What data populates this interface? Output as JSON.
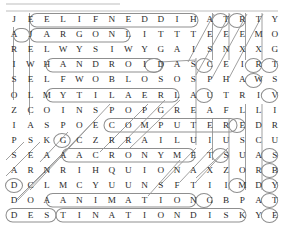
{
  "puzzle": {
    "title": "Word Search Grid",
    "rows": 14,
    "cols": 17,
    "grid": [
      [
        "J",
        "E",
        "E",
        "L",
        "I",
        "F",
        "N",
        "E",
        "D",
        "D",
        "I",
        "H",
        "A",
        "T",
        "R",
        "T",
        "Y"
      ],
      [
        "A",
        "J",
        "A",
        "R",
        "G",
        "O",
        "N",
        "L",
        "I",
        "T",
        "T",
        "T",
        "E",
        "E",
        "E",
        "M",
        "O"
      ],
      [
        "R",
        "E",
        "L",
        "W",
        "Y",
        "S",
        "I",
        "W",
        "Y",
        "G",
        "A",
        "I",
        "S",
        "N",
        "X",
        "X",
        "G"
      ],
      [
        "I",
        "W",
        "H",
        "A",
        "N",
        "D",
        "R",
        "O",
        "I",
        "D",
        "A",
        "S",
        "C",
        "E",
        "I",
        "R",
        "T"
      ],
      [
        "S",
        "E",
        "L",
        "F",
        "W",
        "O",
        "B",
        "L",
        "O",
        "S",
        "O",
        "S",
        "P",
        "H",
        "A",
        "W",
        "S"
      ],
      [
        "O",
        "L",
        "M",
        "Y",
        "T",
        "I",
        "L",
        "A",
        "E",
        "R",
        "L",
        "A",
        "U",
        "T",
        "R",
        "I",
        "V"
      ],
      [
        "Z",
        "C",
        "O",
        "I",
        "N",
        "S",
        "P",
        "O",
        "P",
        "G",
        "R",
        "E",
        "A",
        "F",
        "L",
        "L",
        "I"
      ],
      [
        "I",
        "A",
        "S",
        "P",
        "O",
        "E",
        "C",
        "O",
        "M",
        "P",
        "U",
        "T",
        "E",
        "R",
        "E",
        "D",
        "R"
      ],
      [
        "P",
        "S",
        "K",
        "G",
        "C",
        "Z",
        "R",
        "R",
        "A",
        "I",
        "L",
        "U",
        "I",
        "U",
        "S",
        "C",
        "U"
      ],
      [
        "S",
        "E",
        "A",
        "A",
        "A",
        "C",
        "R",
        "O",
        "N",
        "Y",
        "M",
        "E",
        "T",
        "S",
        "U",
        "A",
        "S"
      ],
      [
        "A",
        "R",
        "N",
        "R",
        "I",
        "H",
        "Q",
        "U",
        "I",
        "O",
        "N",
        "A",
        "X",
        "Z",
        "O",
        "R",
        "B"
      ],
      [
        "D",
        "C",
        "L",
        "M",
        "C",
        "Y",
        "U",
        "U",
        "N",
        "S",
        "F",
        "T",
        "I",
        "I",
        "M",
        "D",
        "Y"
      ],
      [
        "D",
        "O",
        "A",
        "A",
        "N",
        "I",
        "M",
        "A",
        "T",
        "I",
        "O",
        "N",
        "G",
        "B",
        "P",
        "A",
        "T"
      ],
      [
        "D",
        "E",
        "S",
        "T",
        "I",
        "N",
        "A",
        "T",
        "I",
        "O",
        "N",
        "D",
        "I",
        "S",
        "K",
        "Y",
        "E"
      ]
    ],
    "found_words": [
      "FILENAME",
      "JARGON",
      "ANDROID",
      "COMPUTER",
      "ACRONYM",
      "ANIMATION",
      "DESTINATION DISK",
      "MYTILAERLAU",
      "HIDDEN"
    ],
    "colors": {
      "letter": "#2b2b2b",
      "oval_stroke": "#8f8f8f",
      "background": "#ffffff"
    }
  }
}
